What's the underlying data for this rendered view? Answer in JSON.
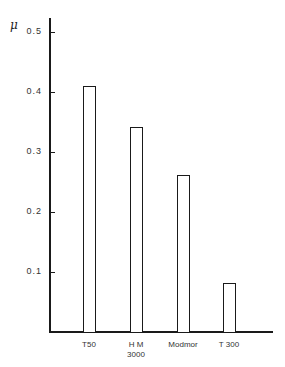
{
  "chart_data": {
    "type": "bar",
    "title": "",
    "xlabel": "",
    "ylabel": "μ",
    "categories": [
      "T50",
      "HM 3000",
      "Modmor",
      "T 300"
    ],
    "category_lines": [
      [
        "T50"
      ],
      [
        "H M",
        "3000"
      ],
      [
        "Modmor"
      ],
      [
        "T 300"
      ]
    ],
    "values": [
      0.41,
      0.342,
      0.262,
      0.082
    ],
    "ylim": [
      0,
      0.55
    ],
    "yticks": [
      0.1,
      0.2,
      0.3,
      0.4,
      0.5
    ],
    "ytick_labels": [
      "0.1",
      "0.2",
      "0.3",
      "0.4",
      "0.5"
    ],
    "grid": false,
    "legend": null,
    "bar_style": "outline",
    "colors": {
      "stroke": "#1a1a1a",
      "fill": "#ffffff"
    }
  },
  "labels": {
    "ylabel": "μ",
    "yticks": [
      "0.1",
      "0.2",
      "0.3",
      "0.4",
      "0.5"
    ],
    "x": [
      {
        "line1": "T50",
        "line2": ""
      },
      {
        "line1": "H M",
        "line2": "3000"
      },
      {
        "line1": "Modmor",
        "line2": ""
      },
      {
        "line1": "T 300",
        "line2": ""
      }
    ]
  }
}
